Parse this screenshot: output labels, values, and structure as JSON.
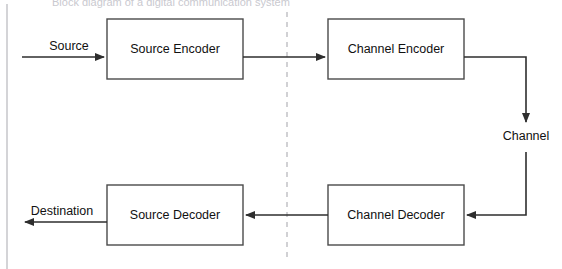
{
  "page": {
    "title_fragment": "Block diagram of a digital communication system",
    "width": 562,
    "height": 269,
    "background_color": "#ffffff",
    "line_color": "#2e2e2e",
    "box_stroke_color": "#4a4a4a",
    "divider_color": "#b9b9bd"
  },
  "diagram": {
    "type": "block-diagram",
    "boxes": [
      {
        "id": "source-encoder",
        "label": "Source Encoder",
        "x": 107,
        "y": 19,
        "w": 136,
        "h": 60
      },
      {
        "id": "channel-encoder",
        "label": "Channel Encoder",
        "x": 328,
        "y": 19,
        "w": 136,
        "h": 60
      },
      {
        "id": "source-decoder",
        "label": "Source Decoder",
        "x": 107,
        "y": 185,
        "w": 136,
        "h": 60
      },
      {
        "id": "channel-decoder",
        "label": "Channel Decoder",
        "x": 328,
        "y": 185,
        "w": 136,
        "h": 60
      }
    ],
    "edge_labels": [
      {
        "id": "source-label",
        "text": "Source",
        "x": 69,
        "y": 50
      },
      {
        "id": "destination-label",
        "text": "Destination",
        "x": 62,
        "y": 215
      },
      {
        "id": "channel-label",
        "text": "Channel",
        "x": 526,
        "y": 140
      }
    ],
    "divider": {
      "id": "transmitter-receiver-divider",
      "x": 287,
      "y1": 12,
      "y2": 262
    },
    "page_edge": {
      "id": "page-left-edge",
      "x": 7,
      "y1": 4,
      "y2": 269
    }
  }
}
